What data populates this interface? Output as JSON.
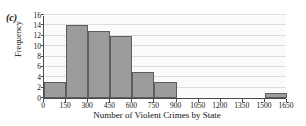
{
  "panel": {
    "label": "(c)"
  },
  "chart_data": {
    "type": "bar",
    "title": "",
    "subtitle": "",
    "xlabel": "Number of Violent Crimes by State",
    "ylabel": "Frequency",
    "categories": [
      "0-150",
      "150-300",
      "300-450",
      "450-600",
      "600-750",
      "750-900",
      "900-1050",
      "1050-1200",
      "1200-1350",
      "1350-1500",
      "1500-1650"
    ],
    "bin_edges": [
      0,
      150,
      300,
      450,
      600,
      750,
      900,
      1050,
      1200,
      1350,
      1500,
      1650
    ],
    "values": [
      3,
      14,
      13,
      12,
      5,
      3,
      0,
      0,
      0,
      0,
      1
    ],
    "bin_width": 150,
    "xlim": [
      0,
      1650
    ],
    "ylim": [
      0,
      16
    ],
    "xticks": [
      0,
      150,
      300,
      450,
      600,
      750,
      900,
      1050,
      1200,
      1350,
      1500,
      1650
    ],
    "yticks": [
      0,
      2,
      4,
      6,
      8,
      10,
      12,
      14,
      16
    ],
    "xtick_labels": [
      "0",
      "150",
      "300",
      "450",
      "600",
      "750",
      "900",
      "1050",
      "1200",
      "1350",
      "1500",
      "1650"
    ],
    "ytick_labels": [
      "0",
      "2",
      "4",
      "6",
      "8",
      "10",
      "12",
      "14",
      "16"
    ],
    "grid": "horizontal",
    "legend": "none",
    "bar_color": "#9c9c9c",
    "bar_edge_color": "#5d5d5d",
    "plot_background": "#fbfbfb",
    "gridline_color": "#dcdcdc",
    "axis_color": "#4a4a4a"
  }
}
